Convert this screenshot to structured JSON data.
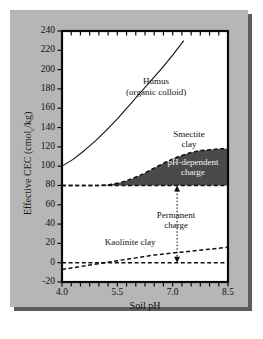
{
  "figure": {
    "background_color": "#b6b6b6",
    "plot_background_color": "#ffffff",
    "shadow_color": "#5d5d5d",
    "shaded_fill_color": "#4a4a4a"
  },
  "axes": {
    "ylabel_prefix": "Effective CEC (cmol",
    "ylabel_sub": "c",
    "ylabel_suffix": "/kg)",
    "xlabel": "Soil pH"
  },
  "chart_data": {
    "type": "line",
    "title": "",
    "xlabel": "Soil pH",
    "ylabel": "Effective CEC (cmol_c/kg)",
    "xlim": [
      4.0,
      8.5
    ],
    "ylim": [
      -20,
      240
    ],
    "grid": false,
    "legend": "none (inline annotations)",
    "xticks": [
      "4.0",
      "5.5",
      "7.0",
      "8.5"
    ],
    "xtick_values": [
      4.0,
      5.5,
      7.0,
      8.5
    ],
    "yticks": [
      "240",
      "220",
      "200",
      "180",
      "160",
      "140",
      "120",
      "100",
      "80",
      "60",
      "40",
      "20",
      "0",
      "-20"
    ],
    "ytick_values": [
      240,
      220,
      200,
      180,
      160,
      140,
      120,
      100,
      80,
      60,
      40,
      20,
      0,
      -20
    ],
    "series": [
      {
        "name": "Humus (organic colloid)",
        "style": "solid",
        "x": [
          4.0,
          4.3,
          4.6,
          4.9,
          5.2,
          5.5,
          5.8,
          6.1,
          6.4,
          6.7,
          7.0,
          7.3
        ],
        "values": [
          100,
          107,
          116,
          126,
          137,
          149,
          162,
          175,
          188,
          201,
          215,
          230
        ]
      },
      {
        "name": "Smectite clay",
        "style": "dashed",
        "x": [
          4.0,
          4.5,
          5.0,
          5.3,
          5.6,
          5.9,
          6.2,
          6.5,
          6.8,
          7.1,
          7.4,
          7.7,
          8.0,
          8.3,
          8.5
        ],
        "values": [
          80,
          80,
          80,
          81,
          83,
          87,
          92,
          98,
          104,
          109,
          113,
          116,
          117,
          118,
          118
        ]
      },
      {
        "name": "Permanent charge baseline",
        "style": "dashed",
        "x": [
          4.0,
          8.5
        ],
        "values": [
          80,
          80
        ]
      },
      {
        "name": "Kaolinite clay",
        "style": "dashed",
        "x": [
          4.0,
          4.5,
          5.0,
          5.5,
          6.0,
          6.5,
          7.0,
          7.5,
          8.0,
          8.5
        ],
        "values": [
          -7,
          -4,
          -1,
          2,
          5,
          8,
          10,
          12,
          14,
          16
        ]
      },
      {
        "name": "Zero line",
        "style": "dashed",
        "x": [
          4.0,
          8.5
        ],
        "values": [
          0,
          0
        ]
      }
    ],
    "shaded_regions": [
      {
        "name": "pH-dependent charge",
        "between": [
          "Smectite clay",
          "Permanent charge baseline"
        ],
        "color": "#4a4a4a"
      }
    ],
    "annotations": [
      {
        "name": "humus-label",
        "line1": "Humus",
        "line2": "(organic colloid)",
        "x": 6.55,
        "y": 182
      },
      {
        "name": "smectite-label",
        "line1": "Smectite",
        "line2": "clay",
        "x": 7.45,
        "y": 128
      },
      {
        "name": "ph-dependent-charge-label",
        "line1": "pH-dependent",
        "line2": "charge",
        "x": 7.55,
        "y": 99
      },
      {
        "name": "permanent-charge-label",
        "line1": "Permanent",
        "line2": "charge",
        "x": 7.1,
        "y": 44
      },
      {
        "name": "kaolinite-label",
        "line1": "Kaolinite clay",
        "line2": "",
        "x": 5.85,
        "y": 21
      }
    ],
    "arrows": [
      {
        "name": "permanent-charge-arrow",
        "style": "dotted double-headed",
        "x": 7.12,
        "y_from": 0,
        "y_to": 80
      }
    ]
  }
}
